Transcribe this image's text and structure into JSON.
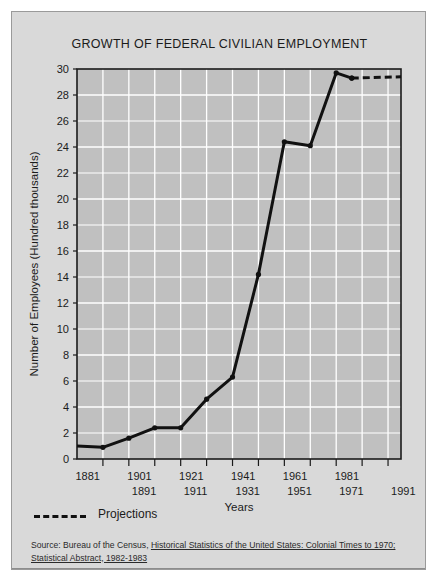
{
  "figure": {
    "title": "GROWTH OF FEDERAL CIVILIAN EMPLOYMENT",
    "background_color": "#d9d9d9",
    "plot_color": "#c0c0c0",
    "grid_color": "#ffffff",
    "line_color": "#111111"
  },
  "legend": {
    "projections_label": "Projections"
  },
  "source": {
    "prefix": "Source: Bureau of the Census, ",
    "italic_1": "Historical Statistics of the United States: Colonial Times to 1970;",
    "italic_2": "Statistical Abstract, 1982-1983"
  },
  "chart_data": {
    "type": "line",
    "title": "GROWTH OF FEDERAL CIVILIAN EMPLOYMENT",
    "xlabel": "Years",
    "ylabel": "Number of Employees (Hundred thousands)",
    "xlim": [
      1871,
      1996
    ],
    "ylim": [
      0,
      30
    ],
    "ytick_values": [
      0,
      2,
      4,
      6,
      8,
      10,
      12,
      14,
      16,
      18,
      20,
      22,
      24,
      26,
      28,
      30
    ],
    "ytick_labels": [
      "0",
      "2",
      "4",
      "6",
      "8",
      "10",
      "12",
      "14",
      "16",
      "18",
      "20",
      "22",
      "24",
      "26",
      "28",
      "30"
    ],
    "xtick_values": [
      1881,
      1891,
      1901,
      1911,
      1921,
      1931,
      1941,
      1951,
      1961,
      1971,
      1981,
      1991
    ],
    "xtick_labels": [
      "1881",
      "1891",
      "1901",
      "1911",
      "1921",
      "1931",
      "1941",
      "1951",
      "1961",
      "1971",
      "1981",
      "1991"
    ],
    "xtick_upper_row": [
      "1881",
      "1901",
      "1921",
      "1941",
      "1961",
      "1981"
    ],
    "xtick_lower_row": [
      "1891",
      "1911",
      "1931",
      "1951",
      "1971",
      "1991"
    ],
    "grid": true,
    "legend_position": "below-axes-left",
    "series": [
      {
        "name": "Federal civilian employment",
        "style": "solid",
        "x": [
          1871,
          1881,
          1891,
          1901,
          1911,
          1921,
          1931,
          1941,
          1951,
          1961,
          1971,
          1977
        ],
        "values": [
          1.0,
          0.9,
          1.6,
          2.4,
          2.4,
          4.6,
          6.3,
          14.2,
          24.4,
          24.1,
          29.7,
          29.3
        ]
      },
      {
        "name": "Projections",
        "style": "dashed",
        "x": [
          1977,
          1996
        ],
        "values": [
          29.3,
          29.4
        ]
      }
    ]
  }
}
